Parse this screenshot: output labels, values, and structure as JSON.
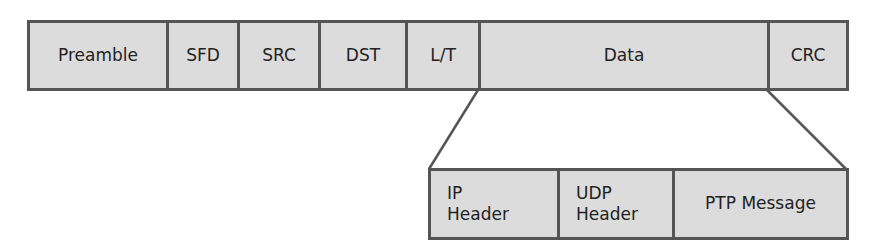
{
  "diagram": {
    "type": "packet-encapsulation",
    "ethernet_frame": {
      "fields": [
        {
          "label": "Preamble",
          "width": 139
        },
        {
          "label": "SFD",
          "width": 71
        },
        {
          "label": "SRC",
          "width": 81
        },
        {
          "label": "DST",
          "width": 87
        },
        {
          "label": "L/T",
          "width": 73
        },
        {
          "label": "Data",
          "width": 289
        },
        {
          "label": "CRC",
          "width": 82
        }
      ]
    },
    "data_expansion": {
      "fields": [
        {
          "label": "IP\nHeader",
          "line1": "IP",
          "line2": "Header",
          "width": 129
        },
        {
          "label": "UDP\nHeader",
          "line1": "UDP",
          "line2": "Header",
          "width": 115
        },
        {
          "label": "PTP Message",
          "width": 177
        }
      ]
    },
    "colors": {
      "fill": "#dcdcdc",
      "border": "#555555",
      "text": "#222222"
    }
  }
}
